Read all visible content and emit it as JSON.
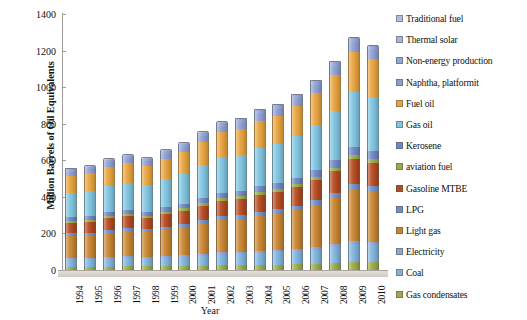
{
  "chart_data": {
    "type": "bar",
    "stacked": true,
    "title": "",
    "xlabel": "Year",
    "ylabel": "Million Barrels of Oil Equivalents",
    "ylim": [
      0,
      1400
    ],
    "ytick_step": 200,
    "yticks": [
      "0",
      "200",
      "400",
      "600",
      "800",
      "1000",
      "1200",
      "1400"
    ],
    "grid": false,
    "legend_position": "right",
    "categories": [
      "1994",
      "1995",
      "1996",
      "1997",
      "1998",
      "1999",
      "2000",
      "2001",
      "2002",
      "2003",
      "2004",
      "2005",
      "2006",
      "2007",
      "2008",
      "2009",
      "2010"
    ],
    "totals": [
      560,
      575,
      615,
      635,
      620,
      660,
      700,
      760,
      815,
      830,
      880,
      910,
      965,
      1040,
      1140,
      1270,
      1230
    ],
    "series": [
      {
        "name": "Gas condensates",
        "color": "#9aab4a",
        "values": [
          18,
          18,
          19,
          20,
          20,
          21,
          22,
          24,
          26,
          27,
          29,
          30,
          32,
          35,
          40,
          46,
          45
        ]
      },
      {
        "name": "Coal",
        "color": "#7fb4dd",
        "values": [
          40,
          41,
          43,
          45,
          44,
          47,
          50,
          54,
          58,
          60,
          63,
          66,
          70,
          76,
          84,
          95,
          92
        ]
      },
      {
        "name": "Electricity",
        "color": "#8fa4d6",
        "values": [
          8,
          8,
          9,
          9,
          9,
          10,
          10,
          11,
          12,
          12,
          13,
          13,
          14,
          15,
          17,
          19,
          18
        ]
      },
      {
        "name": "Light gas",
        "color": "#c8842f",
        "values": [
          120,
          124,
          133,
          138,
          134,
          143,
          152,
          166,
          178,
          182,
          193,
          200,
          212,
          229,
          251,
          280,
          271
        ]
      },
      {
        "name": "LPG",
        "color": "#6f8fc9",
        "values": [
          14,
          14,
          15,
          16,
          16,
          17,
          18,
          19,
          21,
          21,
          22,
          23,
          24,
          26,
          29,
          32,
          31
        ]
      },
      {
        "name": "Gasoline MTBE",
        "color": "#b5491f",
        "values": [
          58,
          60,
          64,
          66,
          64,
          69,
          73,
          79,
          85,
          87,
          92,
          95,
          101,
          109,
          119,
          133,
          129
        ]
      },
      {
        "name": "aviation fuel",
        "color": "#9aab4a",
        "values": [
          10,
          10,
          11,
          11,
          11,
          12,
          12,
          13,
          14,
          15,
          16,
          16,
          17,
          18,
          20,
          22,
          22
        ]
      },
      {
        "name": "Kerosene",
        "color": "#6f86c4",
        "values": [
          20,
          21,
          22,
          23,
          22,
          24,
          25,
          27,
          29,
          30,
          32,
          33,
          35,
          38,
          41,
          46,
          45
        ]
      },
      {
        "name": "Gas oil",
        "color": "#7fc4e0",
        "values": [
          132,
          136,
          145,
          150,
          146,
          156,
          165,
          180,
          193,
          197,
          209,
          216,
          229,
          247,
          271,
          302,
          292
        ]
      },
      {
        "name": "Fuel oil",
        "color": "#e8a33d",
        "values": [
          95,
          97,
          104,
          107,
          104,
          111,
          118,
          128,
          137,
          140,
          148,
          153,
          163,
          176,
          193,
          215,
          208
        ]
      },
      {
        "name": "Naphtha, platformit",
        "color": "#8e9ed2",
        "values": [
          22,
          23,
          24,
          25,
          24,
          26,
          28,
          30,
          32,
          33,
          35,
          36,
          38,
          41,
          45,
          50,
          49
        ]
      },
      {
        "name": "Non-energy production",
        "color": "#93a6d8",
        "values": [
          14,
          14,
          15,
          16,
          16,
          17,
          18,
          19,
          21,
          21,
          22,
          23,
          24,
          26,
          29,
          32,
          31
        ]
      },
      {
        "name": "Thermal solar",
        "color": "#a8b6dd",
        "values": [
          9,
          9,
          11,
          9,
          10,
          7,
          9,
          10,
          9,
          5,
          6,
          6,
          6,
          4,
          1,
          0,
          -3
        ]
      }
    ]
  },
  "legend": {
    "items": [
      {
        "label": "Traditional fuel",
        "color": "#b0bde2"
      },
      {
        "label": "Thermal solar",
        "color": "#a8b6dd"
      },
      {
        "label": "Non-energy production",
        "color": "#93a6d8"
      },
      {
        "label": "Naphtha, platformit",
        "color": "#8e9ed2"
      },
      {
        "label": "Fuel oil",
        "color": "#e8a33d"
      },
      {
        "label": "Gas oil",
        "color": "#7fc4e0"
      },
      {
        "label": "Kerosene",
        "color": "#6f86c4"
      },
      {
        "label": "aviation fuel",
        "color": "#9aab4a"
      },
      {
        "label": "Gasoline MTBE",
        "color": "#b5491f"
      },
      {
        "label": "LPG",
        "color": "#6f8fc9"
      },
      {
        "label": "Light gas",
        "color": "#c8842f"
      },
      {
        "label": "Electricity",
        "color": "#8fa4d6"
      },
      {
        "label": "Coal",
        "color": "#7fb4dd"
      },
      {
        "label": "Gas condensates",
        "color": "#9aab4a"
      }
    ]
  }
}
